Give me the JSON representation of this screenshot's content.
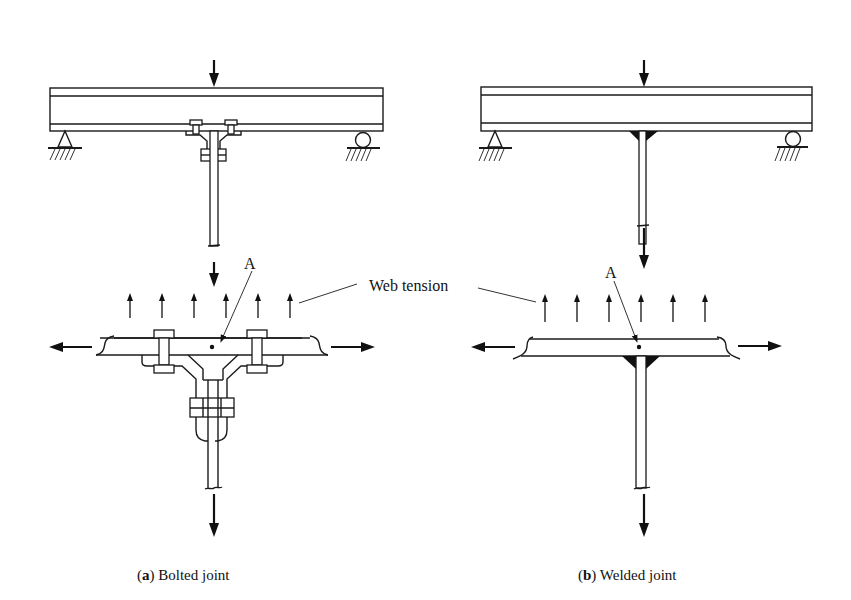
{
  "figure": {
    "annotation": {
      "web_tension_label": "Web tension",
      "point_label_left": "A",
      "point_label_right": "A"
    },
    "panels": [
      {
        "id": "a",
        "caption_letter": "(a)",
        "caption_letter_bold": "a",
        "caption_text": "Bolted joint",
        "joint_type": "bolted"
      },
      {
        "id": "b",
        "caption_letter": "(b)",
        "caption_letter_bold": "b",
        "caption_text": "Welded joint",
        "joint_type": "welded"
      }
    ],
    "colors": {
      "line": "#1a1a1a",
      "background": "#ffffff"
    }
  }
}
